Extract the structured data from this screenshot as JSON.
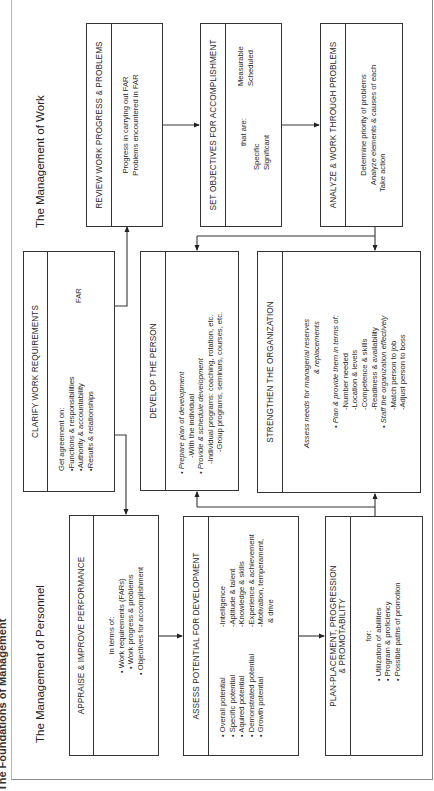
{
  "page_title": "The Foundations of Management",
  "sections": {
    "work": "The Management of Work",
    "personnel": "The Management of Personnel"
  },
  "boxes": {
    "review": {
      "title": "REVIEW WORK PROGRESS & PROBLEMS",
      "lines": [
        "Progress in carrying out FAR",
        "Problems encountered in FAR"
      ]
    },
    "objectives": {
      "title": "SET OBJECTIVES FOR ACCOMPLISHMENT",
      "intro": "that are:",
      "left": [
        "Specific",
        "Significant"
      ],
      "right": [
        "Measurable",
        "Scheduled"
      ]
    },
    "analyze": {
      "title": "ANALYZE & WORK THROUGH PROBLEMS",
      "lines": [
        "Determine priority of problems",
        "Analyze elements & causes of each",
        "Take action"
      ]
    },
    "clarify": {
      "title": "CLARIFY WORK REQUIREMENTS",
      "intro": "Get agreement on:",
      "items": [
        "•Functions & responsibilities",
        "•Authority & accountability",
        "•Results & relationships"
      ],
      "far_label": "FAR"
    },
    "develop": {
      "title": "DEVELOP THE PERSON",
      "lines": [
        {
          "text": "• Prepare plan of development",
          "italic": true
        },
        {
          "text": "-With the individual",
          "italic": false
        },
        {
          "text": "• Provide & schedule development",
          "italic": true
        },
        {
          "text": "-Individual programs:  coaching, rotation, etc.",
          "italic": false
        },
        {
          "text": "-Group programs, seminars, courses, etc.",
          "italic": false
        }
      ]
    },
    "strengthen": {
      "title": "STRENGTHEN THE ORGANIZATION",
      "lines": [
        {
          "text": "Assess needs for managerial reserves",
          "italic": true
        },
        {
          "text": "& replacements",
          "italic": true
        },
        {
          "text": "• Plan & provide them in terms of:",
          "italic": true
        },
        {
          "text": "-Number needed",
          "italic": false
        },
        {
          "text": "-Location & levels",
          "italic": false
        },
        {
          "text": "-Competence & skills",
          "italic": false
        },
        {
          "text": "-Readiness & availability",
          "italic": false
        },
        {
          "text": "• Staff the organization effectively",
          "italic": true
        },
        {
          "text": "-Match person to job",
          "italic": false
        },
        {
          "text": "-Adjust person to boss",
          "italic": false
        }
      ]
    },
    "appraise": {
      "title": "APPRAISE & IMPROVE PERFORMANCE",
      "intro": "in terms of:",
      "items": [
        "• Work requirements (FARs)",
        "• Work progress & problems",
        "• Objectives for accomplishment"
      ]
    },
    "assess": {
      "title": "ASSESS POTENTIAL FOR DEVELOPMENT",
      "left": [
        "• Overall potential",
        "• Specific potential",
        "• Aquired potential",
        "• Demonstrated potential",
        "• Growth potential"
      ],
      "right": [
        "-Intelligence",
        "-Aptitude & talent",
        "-Knowledge & skills",
        "-Experience & achievement",
        "-Motivation, temperament,",
        "& drive"
      ]
    },
    "plan": {
      "title_1": "PLAN-PLACEMENT, PROGRESSION",
      "title_2": "& PROMOTABILITY",
      "intro": "for:",
      "items": [
        "• Utilization of abilities",
        "• Program & proficiency",
        "• Possible paths of promotion"
      ]
    }
  },
  "colors": {
    "line": "#333333",
    "frame": "#8a8a8a",
    "text": "#2a2a2a"
  }
}
